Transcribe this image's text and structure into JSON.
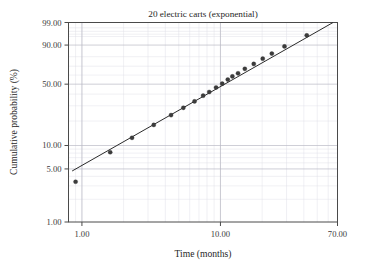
{
  "chart_data": {
    "type": "scatter",
    "title": "20 electric carts (exponential)",
    "xlabel": "Time (months)",
    "ylabel": "Cumulative probability (%)",
    "xscale": "log",
    "yscale": "probability",
    "xlim": [
      0.8,
      70
    ],
    "ylim": [
      1.0,
      99.0
    ],
    "grid": true,
    "legend": null,
    "x_tick_labels": [
      "1.00",
      "10.00",
      "70.00"
    ],
    "x_tick_values": [
      1.0,
      10.0,
      70.0
    ],
    "y_tick_labels": [
      "1.00",
      "5.00",
      "10.00",
      "50.00",
      "90.00",
      "99.00"
    ],
    "y_tick_values": [
      1.0,
      5.0,
      10.0,
      50.0,
      90.0,
      99.0
    ],
    "series": [
      {
        "name": "Median ranks",
        "marker": "filled-circle",
        "color": "#3c3c3c",
        "x": [
          0.9,
          1.6,
          2.3,
          3.3,
          4.4,
          5.4,
          6.5,
          7.5,
          8.3,
          9.3,
          10.3,
          11.3,
          12.2,
          13.4,
          15.0,
          17.4,
          20.2,
          23.5,
          29.0,
          42.0
        ],
        "y": [
          3.4,
          8.2,
          12.5,
          18.0,
          23.5,
          28.5,
          33.5,
          38.5,
          42.0,
          46.5,
          50.5,
          55.0,
          58.5,
          62.0,
          67.0,
          72.5,
          78.0,
          83.0,
          89.0,
          95.5
        ]
      },
      {
        "name": "Exponential fit line",
        "type": "line",
        "color": "#2b2b2b",
        "x": [
          0.85,
          65.0
        ],
        "y": [
          4.7,
          99.0
        ]
      }
    ]
  },
  "figure": {
    "background_color": "#ffffff",
    "frame_color": "#4a4a4a",
    "major_grid_color": "#b9b9c4",
    "minor_grid_color": "#dedee6"
  }
}
